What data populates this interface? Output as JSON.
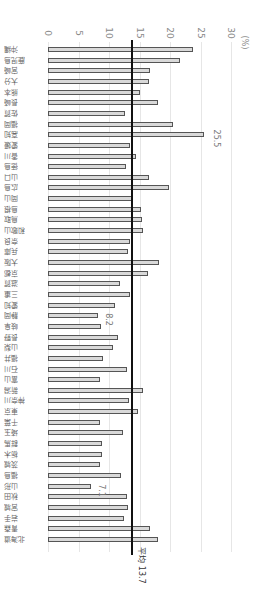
{
  "chart_data": {
    "type": "bar",
    "orientation": "horizontal (image rotated 90°)",
    "title": "",
    "unit_label": "(%)",
    "xlim": [
      0,
      30
    ],
    "ticks": [
      "0",
      "5",
      "10",
      "15",
      "20",
      "25",
      "30"
    ],
    "mean": {
      "label": "平均",
      "value": "13.7"
    },
    "annotations": [
      {
        "category": "高知",
        "text": "25.5"
      },
      {
        "category": "静岡",
        "text": "8.2"
      },
      {
        "category": "山形",
        "text": "7.1"
      }
    ],
    "categories": [
      "沖縄",
      "鹿児島",
      "宮崎",
      "大分",
      "熊本",
      "長崎",
      "佐賀",
      "福岡",
      "高知",
      "愛媛",
      "香川",
      "徳島",
      "山口",
      "広島",
      "岡山",
      "島根",
      "鳥取",
      "和歌山",
      "奈良",
      "兵庫",
      "大阪",
      "京都",
      "滋賀",
      "三重",
      "愛知",
      "静岡",
      "岐阜",
      "長野",
      "山梨",
      "福井",
      "石川",
      "富山",
      "新潟",
      "神奈川",
      "東京",
      "千葉",
      "埼玉",
      "群馬",
      "栃木",
      "茨城",
      "福島",
      "山形",
      "秋田",
      "宮城",
      "岩手",
      "青森",
      "北海道"
    ],
    "values": [
      23.8,
      21.6,
      16.7,
      16.6,
      15.1,
      18.0,
      12.6,
      20.5,
      25.5,
      13.4,
      14.5,
      12.8,
      16.5,
      19.9,
      14.0,
      15.2,
      15.4,
      15.5,
      13.4,
      13.1,
      18.2,
      16.4,
      11.8,
      13.4,
      11.0,
      8.2,
      8.7,
      11.5,
      10.6,
      9.0,
      13.0,
      8.5,
      15.6,
      13.3,
      14.7,
      8.6,
      12.3,
      8.8,
      8.8,
      8.5,
      12.0,
      7.1,
      12.9,
      13.1,
      12.5,
      16.7,
      18.1
    ]
  }
}
